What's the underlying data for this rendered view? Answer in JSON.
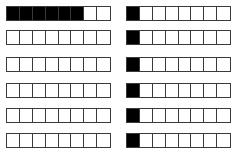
{
  "diagram": {
    "colors": {
      "filled": "#000000",
      "empty": "#ffffff",
      "border": "#3a3a3a"
    },
    "cells_per_strip": 8,
    "columns": [
      {
        "name": "left",
        "x": 6,
        "strips": [
          {
            "y": 6,
            "filled_count": 6
          },
          {
            "y": 30,
            "filled_count": 0
          },
          {
            "y": 57,
            "filled_count": 0
          },
          {
            "y": 83,
            "filled_count": 0
          },
          {
            "y": 108,
            "filled_count": 0
          },
          {
            "y": 133,
            "filled_count": 0
          }
        ]
      },
      {
        "name": "right",
        "x": 126,
        "strips": [
          {
            "y": 6,
            "filled_count": 1
          },
          {
            "y": 30,
            "filled_count": 1
          },
          {
            "y": 57,
            "filled_count": 1
          },
          {
            "y": 83,
            "filled_count": 1
          },
          {
            "y": 108,
            "filled_count": 1
          },
          {
            "y": 133,
            "filled_count": 1
          }
        ]
      }
    ]
  }
}
